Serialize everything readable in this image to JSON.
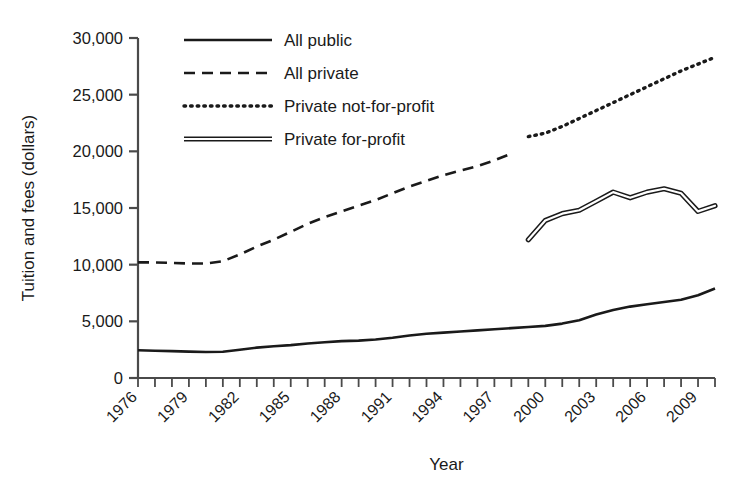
{
  "chart_data": {
    "type": "line",
    "title": "",
    "xlabel": "Year",
    "ylabel": "Tuition and fees (dollars)",
    "xlim": [
      1976,
      2010
    ],
    "ylim": [
      0,
      30000
    ],
    "grid": false,
    "legend_position": "top-center",
    "y_ticks": [
      0,
      5000,
      10000,
      15000,
      20000,
      25000,
      30000
    ],
    "y_tick_labels": [
      "0",
      "5,000",
      "10,000",
      "15,000",
      "20,000",
      "25,000",
      "30,000"
    ],
    "x_ticks": [
      1976,
      1977,
      1978,
      1979,
      1980,
      1981,
      1982,
      1983,
      1984,
      1985,
      1986,
      1987,
      1988,
      1989,
      1990,
      1991,
      1992,
      1993,
      1994,
      1995,
      1996,
      1997,
      1998,
      1999,
      2000,
      2001,
      2002,
      2003,
      2004,
      2005,
      2006,
      2007,
      2008,
      2009,
      2010
    ],
    "x_tick_labels": [
      "1976",
      "1979",
      "1982",
      "1985",
      "1988",
      "1991",
      "1994",
      "1997",
      "2000",
      "2003",
      "2006",
      "2009"
    ],
    "x_tick_labels_years": [
      1976,
      1979,
      1982,
      1985,
      1988,
      1991,
      1994,
      1997,
      2000,
      2003,
      2006,
      2009
    ],
    "series": [
      {
        "name": "All public",
        "style": "solid",
        "color": "#1a1a1a",
        "x": [
          1976,
          1977,
          1978,
          1979,
          1980,
          1981,
          1982,
          1983,
          1984,
          1985,
          1986,
          1987,
          1988,
          1989,
          1990,
          1991,
          1992,
          1993,
          1994,
          1995,
          1996,
          1997,
          1998,
          1999,
          2000,
          2001,
          2002,
          2003,
          2004,
          2005,
          2006,
          2007,
          2008,
          2009,
          2010
        ],
        "values": [
          2450,
          2400,
          2370,
          2330,
          2300,
          2320,
          2500,
          2680,
          2800,
          2900,
          3050,
          3150,
          3250,
          3300,
          3400,
          3550,
          3750,
          3900,
          4000,
          4100,
          4200,
          4300,
          4400,
          4500,
          4600,
          4800,
          5100,
          5600,
          6000,
          6300,
          6500,
          6700,
          6900,
          7300,
          7900
        ]
      },
      {
        "name": "All private",
        "style": "dashed",
        "color": "#1a1a1a",
        "x": [
          1976,
          1977,
          1978,
          1979,
          1980,
          1981,
          1982,
          1983,
          1984,
          1985,
          1986,
          1987,
          1988,
          1989,
          1990,
          1991,
          1992,
          1993,
          1994,
          1995,
          1996,
          1997,
          1998
        ],
        "values": [
          10200,
          10200,
          10150,
          10100,
          10100,
          10300,
          10900,
          11600,
          12200,
          12900,
          13600,
          14200,
          14700,
          15200,
          15700,
          16300,
          16900,
          17400,
          17900,
          18300,
          18700,
          19200,
          19800
        ]
      },
      {
        "name": "Private not-for-profit",
        "style": "dotted",
        "color": "#1a1a1a",
        "x": [
          1999,
          2000,
          2001,
          2002,
          2003,
          2004,
          2005,
          2006,
          2007,
          2008,
          2009,
          2010
        ],
        "values": [
          21300,
          21600,
          22200,
          22900,
          23600,
          24300,
          25000,
          25700,
          26400,
          27100,
          27700,
          28300
        ]
      },
      {
        "name": "Private for-profit",
        "style": "double",
        "color": "#1a1a1a",
        "x": [
          1999,
          2000,
          2001,
          2002,
          2003,
          2004,
          2005,
          2006,
          2007,
          2008,
          2009,
          2010
        ],
        "values": [
          12200,
          13900,
          14500,
          14800,
          15600,
          16400,
          15900,
          16400,
          16700,
          16300,
          14700,
          15200
        ]
      }
    ]
  },
  "legend": {
    "items": [
      {
        "label": "All public",
        "style": "solid"
      },
      {
        "label": "All private",
        "style": "dashed"
      },
      {
        "label": "Private not-for-profit",
        "style": "dotted"
      },
      {
        "label": "Private for-profit",
        "style": "double"
      }
    ]
  },
  "axes": {
    "x_title": "Year",
    "y_title": "Tuition and fees (dollars)"
  }
}
